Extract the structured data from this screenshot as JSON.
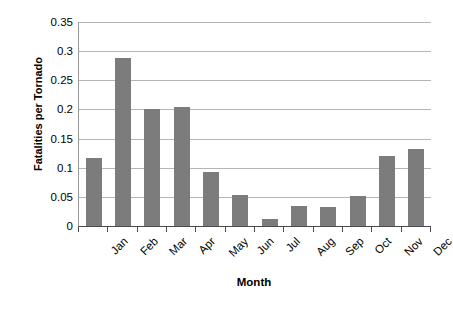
{
  "chart_data": {
    "type": "bar",
    "title": "",
    "xlabel": "Month",
    "ylabel": "Fatalities per Tornado",
    "categories": [
      "Jan",
      "Feb",
      "Mar",
      "Apr",
      "May",
      "Jun",
      "Jul",
      "Aug",
      "Sep",
      "Oct",
      "Nov",
      "Dec"
    ],
    "values": [
      0.117,
      0.289,
      0.2,
      0.205,
      0.092,
      0.053,
      0.012,
      0.034,
      0.033,
      0.051,
      0.12,
      0.132
    ],
    "ylim": [
      0,
      0.35
    ],
    "ytick_labels": [
      "0",
      "0.05",
      "0.1",
      "0.15",
      "0.2",
      "0.25",
      "0.3",
      "0.35"
    ],
    "ytick_values": [
      0,
      0.05,
      0.1,
      0.15,
      0.2,
      0.25,
      0.3,
      0.35
    ],
    "grid": true,
    "legend": false,
    "legend_position": "none",
    "bar_color": "#7c7c7c",
    "gridline_color": "#b5b5b5",
    "axis_color": "#4a4a4a",
    "background_color": "#ffffff",
    "xtick_label_rotation": -45
  }
}
